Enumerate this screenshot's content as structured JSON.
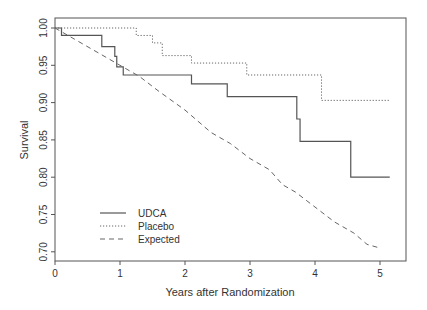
{
  "chart_data": {
    "type": "line",
    "title": "",
    "xlabel": "Years after Randomization",
    "ylabel": "Survival",
    "xlim": [
      0,
      5.3
    ],
    "ylim": [
      0.69,
      1.01
    ],
    "x_ticks": [
      0,
      1,
      2,
      3,
      4,
      5
    ],
    "x_tick_labels": [
      "0",
      "1",
      "2",
      "3",
      "4",
      "5"
    ],
    "y_ticks": [
      0.7,
      0.75,
      0.8,
      0.85,
      0.9,
      0.95,
      1.0
    ],
    "y_tick_labels": [
      "0.70",
      "0.75",
      "0.80",
      "0.85",
      "0.90",
      "0.95",
      "1.00"
    ],
    "grid": false,
    "legend_position": "lower left",
    "series": [
      {
        "name": "UDCA",
        "style": "solid",
        "step": true,
        "points": [
          [
            0,
            1.0
          ],
          [
            0.1,
            0.99
          ],
          [
            0.72,
            0.975
          ],
          [
            0.92,
            0.962
          ],
          [
            0.95,
            0.948
          ],
          [
            1.05,
            0.937
          ],
          [
            2.1,
            0.925
          ],
          [
            2.65,
            0.908
          ],
          [
            3.72,
            0.878
          ],
          [
            3.77,
            0.848
          ],
          [
            4.55,
            0.8
          ],
          [
            5.15,
            0.8
          ]
        ]
      },
      {
        "name": "Placebo",
        "style": "dotted",
        "step": true,
        "points": [
          [
            0,
            1.0
          ],
          [
            1.25,
            0.99
          ],
          [
            1.5,
            0.98
          ],
          [
            1.65,
            0.963
          ],
          [
            2.1,
            0.953
          ],
          [
            2.95,
            0.937
          ],
          [
            4.1,
            0.903
          ],
          [
            5.15,
            0.903
          ]
        ]
      },
      {
        "name": "Expected",
        "style": "dashed",
        "step": false,
        "points": [
          [
            0,
            1.0
          ],
          [
            0.3,
            0.985
          ],
          [
            0.6,
            0.97
          ],
          [
            1.0,
            0.95
          ],
          [
            1.3,
            0.935
          ],
          [
            1.6,
            0.915
          ],
          [
            2.0,
            0.89
          ],
          [
            2.2,
            0.875
          ],
          [
            2.4,
            0.86
          ],
          [
            2.7,
            0.845
          ],
          [
            3.0,
            0.825
          ],
          [
            3.3,
            0.81
          ],
          [
            3.5,
            0.79
          ],
          [
            3.7,
            0.78
          ],
          [
            4.0,
            0.76
          ],
          [
            4.3,
            0.74
          ],
          [
            4.6,
            0.725
          ],
          [
            4.8,
            0.71
          ],
          [
            5.0,
            0.705
          ]
        ]
      }
    ]
  }
}
